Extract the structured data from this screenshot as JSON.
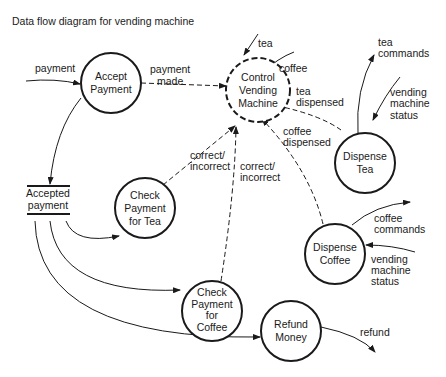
{
  "title": "Data flow diagram for vending machine",
  "processes": {
    "accept_payment": [
      "Accept",
      "Payment"
    ],
    "control_vending_machine": [
      "Control",
      "Vending",
      "Machine"
    ],
    "dispense_tea": [
      "Dispense",
      "Tea"
    ],
    "check_payment_tea": [
      "Check",
      "Payment",
      "for Tea"
    ],
    "dispense_coffee": [
      "Dispense",
      "Coffee"
    ],
    "check_payment_coffee": [
      "Check",
      "Payment",
      "for",
      "Coffee"
    ],
    "refund_money": [
      "Refund",
      "Money"
    ]
  },
  "data_store": [
    "Accepted",
    "payment"
  ],
  "flows": {
    "payment": "payment",
    "payment_made": [
      "payment",
      "made"
    ],
    "tea": "tea",
    "coffee": "coffee",
    "tea_commands": [
      "tea",
      "commands"
    ],
    "vending_status_tea": [
      "vending",
      "machine",
      "status"
    ],
    "tea_dispensed": [
      "tea",
      "dispensed"
    ],
    "coffee_dispensed": [
      "coffee",
      "dispensed"
    ],
    "correct_incorrect_tea": [
      "correct/",
      "incorrect"
    ],
    "correct_incorrect_coffee": [
      "correct/",
      "incorrect"
    ],
    "coffee_commands": [
      "coffee",
      "commands"
    ],
    "vending_status_coffee": [
      "vending",
      "machine",
      "status"
    ],
    "refund": "refund"
  }
}
